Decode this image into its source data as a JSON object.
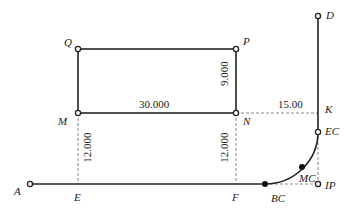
{
  "diagram": {
    "type": "surveying-layout-with-curve",
    "colors": {
      "line": "#222222",
      "dashed": "#888888",
      "background": "#ffffff"
    },
    "points": [
      {
        "id": "Q",
        "label": "Q",
        "x": 78,
        "y": 49,
        "marker": "open"
      },
      {
        "id": "P",
        "label": "P",
        "x": 236,
        "y": 49,
        "marker": "open"
      },
      {
        "id": "M",
        "label": "M",
        "x": 78,
        "y": 113,
        "marker": "open"
      },
      {
        "id": "N",
        "label": "N",
        "x": 236,
        "y": 113,
        "marker": "open"
      },
      {
        "id": "A",
        "label": "A",
        "x": 30,
        "y": 184,
        "marker": "open"
      },
      {
        "id": "E",
        "label": "E",
        "x": 78,
        "y": 184,
        "marker": "none"
      },
      {
        "id": "F",
        "label": "F",
        "x": 236,
        "y": 184,
        "marker": "none"
      },
      {
        "id": "BC",
        "label": "BC",
        "x": 265,
        "y": 184,
        "marker": "filled"
      },
      {
        "id": "MC",
        "label": "MC",
        "x": 302,
        "y": 167,
        "marker": "filled"
      },
      {
        "id": "EC",
        "label": "EC",
        "x": 318,
        "y": 132,
        "marker": "open"
      },
      {
        "id": "IP",
        "label": "IP",
        "x": 318,
        "y": 184,
        "marker": "open"
      },
      {
        "id": "K",
        "label": "K",
        "x": 318,
        "y": 113,
        "marker": "none"
      },
      {
        "id": "D",
        "label": "D",
        "x": 318,
        "y": 16,
        "marker": "open"
      }
    ],
    "dimensions": {
      "MN": "30.000",
      "PN": "9.000",
      "ME": "12.000",
      "NF": "12.000",
      "NK": "15.00"
    },
    "edges": {
      "solid": [
        "Q-P",
        "P-N",
        "N-M",
        "M-Q",
        "A-BC",
        "EC-D"
      ],
      "dashed": [
        "M-E",
        "N-F",
        "N-K",
        "BC-IP",
        "IP-EC"
      ],
      "curve": [
        "BC-MC-EC"
      ]
    }
  }
}
